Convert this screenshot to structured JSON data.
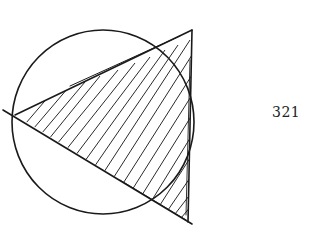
{
  "figure": {
    "circle": {
      "cx": 103,
      "cy": 120,
      "r": 91
    },
    "triangle": {
      "points": [
        [
          15,
          115
        ],
        [
          192,
          30
        ],
        [
          188,
          222
        ]
      ]
    },
    "stroke_color": "#1a1a1a",
    "hatch": {
      "direction": "diagonal",
      "count": 22
    }
  },
  "page_number": "321"
}
